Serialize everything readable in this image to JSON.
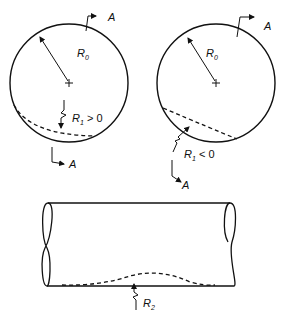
{
  "diagram": {
    "left_circle": {
      "radius_label": "R",
      "radius_sub": "0",
      "curvature_label": "R",
      "curvature_sub": "1",
      "curvature_relation": " > 0",
      "section_top": "A",
      "section_bottom": "A"
    },
    "right_circle": {
      "radius_label": "R",
      "radius_sub": "0",
      "curvature_label": "R",
      "curvature_sub": "1",
      "curvature_relation": " < 0",
      "section_top": "A",
      "section_bottom": "A"
    },
    "cylinder": {
      "curvature_label": "R",
      "curvature_sub": "2"
    },
    "colors": {
      "stroke": "#111111",
      "background": "#ffffff"
    }
  }
}
